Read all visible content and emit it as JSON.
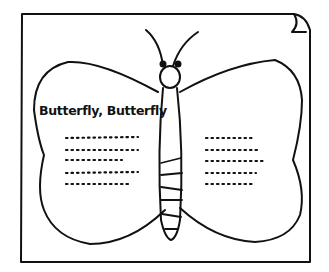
{
  "illustration": {
    "title": "Butterfly, Butterfly",
    "subject": "butterfly-outline-worksheet",
    "stroke_color": "#111111",
    "background_color": "#ffffff",
    "left_wing_text_lines": 5,
    "right_wing_text_lines": 5
  }
}
